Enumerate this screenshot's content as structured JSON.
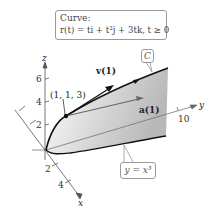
{
  "figure": {
    "curve_box": {
      "title": "Curve:",
      "equation": "r(t) = ti + t²j + 3tk, t ≥ 0"
    },
    "curve_label": "C",
    "surface_label": "y = x³",
    "point_label": "(1, 1, 3)",
    "vectors": {
      "velocity": "v(1)",
      "acceleration": "a(1)"
    },
    "axes": {
      "z": {
        "label": "z",
        "ticks": [
          "6",
          "4",
          "2"
        ]
      },
      "x": {
        "label": "x",
        "ticks": [
          "2",
          "4"
        ]
      },
      "y": {
        "label": "y",
        "ticks": [
          "10"
        ]
      }
    },
    "colors": {
      "axis": "#555555",
      "curve": "#111111",
      "surface_light": "#f2f2f2",
      "surface_dark": "#bdbdbd",
      "box_border": "#9a9a9a"
    }
  }
}
